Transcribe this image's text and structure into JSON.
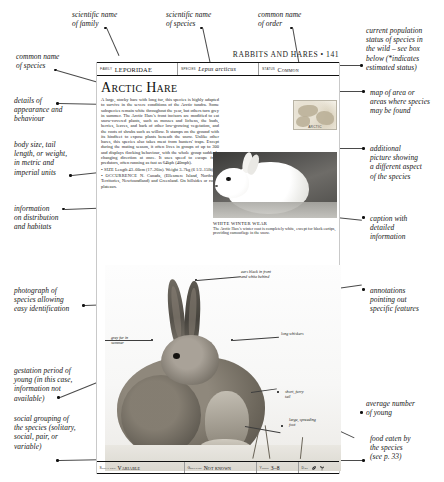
{
  "page": {
    "folio": "RABBITS AND HARES • 141",
    "header_fields": [
      {
        "key": "Family",
        "value": "LEPORIDAE",
        "italic": false
      },
      {
        "key": "Species",
        "value": "Lepus arcticus",
        "italic": true
      },
      {
        "key": "Status",
        "value": "Common",
        "italic": false
      }
    ],
    "title": "Arctic Hare",
    "body_paragraphs": [
      "A large, stocky hare with long fur, this species is highly adapted to survive in the severe conditions of the Arctic tundra. Some subspecies remain white throughout the year, but others turn grey in summer. The Arctic Hare's front incisors are modified to eat snow-covered plants, such as mosses and lichens, the buds, berries, leaves, and bark of other low-growing vegetation, and the roots of shrubs such as willow. It stamps on the ground with its hindfeet to expose plants beneath the snow. Unlike other hares, this species also takes meat from hunters' traps. Except during the mating season, it often lives in groups of up to 300 and displays flocking behaviour, with the whole group suddenly changing direction at once. It uses speed to escape from predators, often running as fast as 64kph (40mph)."
    ],
    "facts": [
      {
        "label": "SIZE",
        "text": "Length 43–66cm (17–26in). Weight 3–7kg (6 1/2–15lb)."
      },
      {
        "label": "OCCURRENCE",
        "text": "N. Canada, (Ellesmere Island, Northwest Territories, Newfoundland) and Greenland. On hillsides or rocky plateaux."
      }
    ],
    "map_label": "ARCTIC",
    "photo_white": {
      "caption_head": "WHITE WINTER WEAR",
      "caption_body": "The Arctic Hare's winter coat is completely white, except for black eartips, providing camouflage in the snow."
    },
    "photo_annotations": [
      {
        "id": "ears-black-front",
        "text": "ears black in front\nand white behind"
      },
      {
        "id": "long-whiskers",
        "text": "long whiskers"
      },
      {
        "id": "grey-fur-summer",
        "text": "grey fur in\nsummer"
      },
      {
        "id": "short-furry-tail",
        "text": "short, furry\ntail"
      },
      {
        "id": "large-spreading-foot",
        "text": "large, spreading\nfoot"
      }
    ],
    "data_band": [
      {
        "key": "Social unit",
        "value": "Variable"
      },
      {
        "key": "Gestation",
        "value": "Not known"
      },
      {
        "key": "Young",
        "value": "3–8"
      },
      {
        "key": "Diet",
        "value": ""
      }
    ],
    "diet_icons": [
      "leaf-icon",
      "sprout-icon"
    ]
  },
  "annotations": {
    "left": [
      {
        "id": "scientific-name-of-family",
        "text": "scientific name\nof family"
      },
      {
        "id": "scientific-name-of-species",
        "text": "scientific name\nof species"
      },
      {
        "id": "common-name-of-order",
        "text": "common name\nof order"
      },
      {
        "id": "common-name-of-species",
        "text": "common name\nof species"
      },
      {
        "id": "details-of-appearance",
        "text": "details of\nappearance and\nbehaviour"
      },
      {
        "id": "body-size-units",
        "text": "body size, tail\nlength, or weight,\nin metric and\nimperial units"
      },
      {
        "id": "information-distribution",
        "text": "information\non distribution\nand habitats"
      },
      {
        "id": "photograph-of-species",
        "text": "photograph of\nspecies allowing\neasy identification"
      },
      {
        "id": "gestation-period",
        "text": "gestation period of\nyoung (in this case,\ninformation not\navailable)"
      },
      {
        "id": "social-grouping",
        "text": "social grouping of\nthe species (solitary,\nsocial, pair, or\nvariable)"
      }
    ],
    "right": [
      {
        "id": "current-population-status",
        "text": "current population\nstatus of species in\nthe wild – see box\nbelow (*indicates\nestimated status)"
      },
      {
        "id": "map-of-area",
        "text": "map of area or\nareas where species\nmay be found"
      },
      {
        "id": "additional-picture",
        "text": "additional\npicture showing\na different aspect\nof the species"
      },
      {
        "id": "caption-with-detail",
        "text": "caption with\ndetailed\ninformation"
      },
      {
        "id": "annotations-features",
        "text": "annotations\npointing out\nspecific features"
      },
      {
        "id": "average-number-young",
        "text": "average number\nof young"
      },
      {
        "id": "food-eaten",
        "text": "food eaten by\nthe species\n(see p. 33)"
      }
    ]
  },
  "colors": {
    "ink": "#1a1a1a",
    "rule": "#111111",
    "leader": "#4a4a4a",
    "paper": "#ffffff"
  }
}
